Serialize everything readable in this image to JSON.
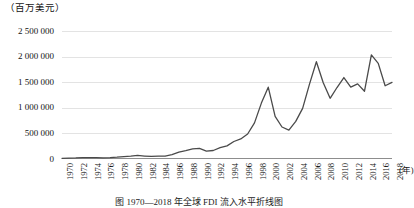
{
  "figure": {
    "y_unit_label": "（百万美元）",
    "x_unit_label": "(年)",
    "caption": "图 1970—2018 年全球 FDI 流入水平折线图"
  },
  "chart_data": {
    "type": "line",
    "title": "",
    "subtitle": "",
    "xlabel": "(年)",
    "ylabel": "（百万美元）",
    "ylim": [
      0,
      2500000
    ],
    "xlim": [
      1970,
      2018
    ],
    "grid": true,
    "legend": false,
    "legend_position": "none",
    "y_ticks": [
      0,
      500000,
      1000000,
      1500000,
      2000000,
      2500000
    ],
    "y_tick_labels": [
      "0",
      "500 000",
      "1 000 000",
      "1 500 000",
      "2 000 000",
      "2 500 000"
    ],
    "x_tick_labels": [
      "1970",
      "1972",
      "1974",
      "1976",
      "1978",
      "1980",
      "1982",
      "1984",
      "1986",
      "1988",
      "1990",
      "1992",
      "1994",
      "1996",
      "1998",
      "2000",
      "2002",
      "2004",
      "2006",
      "2008",
      "2010",
      "2012",
      "2014",
      "2016",
      "2018"
    ],
    "line_color": "#4a4a4a",
    "x": [
      1970,
      1971,
      1972,
      1973,
      1974,
      1975,
      1976,
      1977,
      1978,
      1979,
      1980,
      1981,
      1982,
      1983,
      1984,
      1985,
      1986,
      1987,
      1988,
      1989,
      1990,
      1991,
      1992,
      1993,
      1994,
      1995,
      1996,
      1997,
      1998,
      1999,
      2000,
      2001,
      2002,
      2003,
      2004,
      2005,
      2006,
      2007,
      2008,
      2009,
      2010,
      2011,
      2012,
      2013,
      2014,
      2015,
      2016,
      2017,
      2018
    ],
    "series": [
      {
        "name": "全球FDI流入量",
        "values": [
          13300,
          18300,
          20300,
          26400,
          27000,
          26500,
          23000,
          27000,
          35000,
          47000,
          55000,
          69000,
          58000,
          50000,
          56000,
          56000,
          86000,
          135000,
          163000,
          198000,
          207000,
          155000,
          166000,
          221000,
          256000,
          342000,
          391000,
          488000,
          705000,
          1092000,
          1402000,
          831000,
          625000,
          564000,
          734000,
          989000,
          1463000,
          1900000,
          1490000,
          1186000,
          1396000,
          1591000,
          1403000,
          1467000,
          1324000,
          2034000,
          1868000,
          1430000,
          1497000
        ]
      }
    ]
  }
}
